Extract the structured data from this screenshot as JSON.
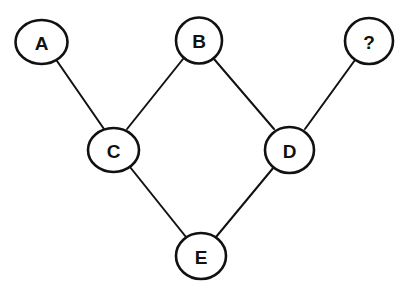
{
  "diagram": {
    "type": "directed-acyclic-graph",
    "caption": "",
    "style": {
      "stroke_color": "#111111",
      "background": "#ffffff"
    },
    "nodes": [
      {
        "id": "A",
        "label": "A",
        "cx": 41.5,
        "cy": 42,
        "rx": 26,
        "ry": 22
      },
      {
        "id": "B",
        "label": "B",
        "cx": 199,
        "cy": 40.5,
        "rx": 23,
        "ry": 23
      },
      {
        "id": "Q",
        "label": "?",
        "cx": 369,
        "cy": 41,
        "rx": 24,
        "ry": 23
      },
      {
        "id": "C",
        "label": "C",
        "cx": 113.5,
        "cy": 150,
        "rx": 25.5,
        "ry": 22
      },
      {
        "id": "D",
        "label": "D",
        "cx": 289.5,
        "cy": 150,
        "rx": 24.5,
        "ry": 23
      },
      {
        "id": "E",
        "label": "E",
        "cx": 201,
        "cy": 256,
        "rx": 25,
        "ry": 23
      }
    ],
    "edges": [
      {
        "from": "A",
        "to": "C",
        "x1": 57,
        "y1": 61,
        "x2": 104,
        "y2": 129
      },
      {
        "from": "B",
        "to": "C",
        "x1": 183,
        "y1": 59,
        "x2": 127,
        "y2": 129
      },
      {
        "from": "B",
        "to": "D",
        "x1": 214,
        "y1": 59,
        "x2": 274,
        "y2": 129
      },
      {
        "from": "Q",
        "to": "D",
        "x1": 355,
        "y1": 60,
        "x2": 305,
        "y2": 129
      },
      {
        "from": "C",
        "to": "E",
        "x1": 130,
        "y1": 167,
        "x2": 186,
        "y2": 237
      },
      {
        "from": "D",
        "to": "E",
        "x1": 274,
        "y1": 167,
        "x2": 216,
        "y2": 237
      }
    ]
  }
}
